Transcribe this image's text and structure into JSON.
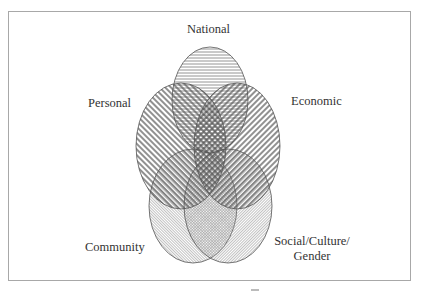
{
  "diagram": {
    "type": "venn",
    "sets": [
      {
        "id": "national",
        "label": "National",
        "pattern": "horizontal-lines"
      },
      {
        "id": "personal",
        "label": "Personal",
        "pattern": "diagonal-lines-forward"
      },
      {
        "id": "economic",
        "label": "Economic",
        "pattern": "diagonal-lines-backward"
      },
      {
        "id": "community",
        "label": "Community",
        "pattern": "fine-diagonal-forward"
      },
      {
        "id": "social",
        "label_lines": [
          "Social/Culture/",
          "Gender"
        ],
        "pattern": "fine-diagonal-backward"
      }
    ],
    "colors": {
      "stroke": "#555555",
      "hatch": "#6a6a6a",
      "frame": "#a8a8a8",
      "text": "#333333"
    }
  }
}
